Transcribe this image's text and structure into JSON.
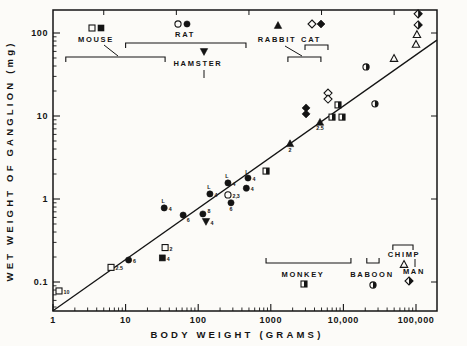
{
  "figure": {
    "background": "#fcfbf8",
    "ink_color": "#141414"
  },
  "chart_data": {
    "type": "scatter",
    "title": "",
    "xlabel": "BODY WEIGHT (GRAMS)",
    "ylabel": "WET WEIGHT OF GANGLION (mg)",
    "x_scale": "log",
    "y_scale": "log",
    "xlim": [
      1,
      194000
    ],
    "ylim": [
      0.045,
      190
    ],
    "grid": false,
    "x_ticks": {
      "values": [
        1,
        10,
        100,
        1000,
        10000,
        100000
      ],
      "labels": [
        "1",
        "10",
        "100",
        "1000",
        "10,000",
        "100,000"
      ]
    },
    "y_ticks": {
      "values": [
        100,
        10,
        1,
        0.1
      ],
      "labels": [
        "100",
        "10",
        "1",
        "0.1"
      ]
    },
    "trend_line": {
      "x1": 1,
      "y1": 0.045,
      "x2": 194000,
      "y2": 82
    },
    "series": [
      {
        "name": "MOUSE",
        "points": [
          {
            "x": 1.21,
            "y": 0.078,
            "symbol": "square-open",
            "label": "10",
            "label_pos": "right"
          },
          {
            "x": 6.3,
            "y": 0.15,
            "symbol": "square-open",
            "label": "2.5",
            "label_pos": "right"
          },
          {
            "x": 32,
            "y": 0.195,
            "symbol": "square-filled",
            "label": "4",
            "label_pos": "right"
          },
          {
            "x": 35,
            "y": 0.26,
            "symbol": "square-open",
            "label": "2",
            "label_pos": "right"
          }
        ]
      },
      {
        "name": "RAT",
        "points": [
          {
            "x": 11,
            "y": 0.184,
            "symbol": "circle-filled",
            "label": "6",
            "label_pos": "right"
          },
          {
            "x": 34,
            "y": 0.78,
            "symbol": "circle-filled",
            "label": "4",
            "label_pos": "right",
            "flag": "L"
          },
          {
            "x": 62,
            "y": 0.64,
            "symbol": "circle-filled",
            "label": "6",
            "label_pos": "below-right"
          },
          {
            "x": 116,
            "y": 0.66,
            "symbol": "circle-filled",
            "label": "8",
            "label_pos": "upper-right"
          },
          {
            "x": 145,
            "y": 1.15,
            "symbol": "circle-filled",
            "label": "4",
            "label_pos": "right",
            "flag": "L"
          },
          {
            "x": 257,
            "y": 1.56,
            "symbol": "circle-filled",
            "label": "4",
            "label_pos": "right",
            "flag": "L"
          },
          {
            "x": 257,
            "y": 1.12,
            "symbol": "circle-open",
            "label": "2,3",
            "label_pos": "right"
          },
          {
            "x": 283,
            "y": 0.9,
            "symbol": "circle-filled",
            "label": "6",
            "label_pos": "below"
          },
          {
            "x": 485,
            "y": 1.79,
            "symbol": "circle-filled",
            "label": "4",
            "label_pos": "right",
            "flag": "L"
          },
          {
            "x": 460,
            "y": 1.35,
            "symbol": "circle-filled",
            "label": "4",
            "label_pos": "right"
          }
        ]
      },
      {
        "name": "HAMSTER",
        "points": [
          {
            "x": 128,
            "y": 0.53,
            "symbol": "triangle-down-filled",
            "label": "4",
            "label_pos": "right"
          }
        ]
      },
      {
        "name": "RABBIT",
        "points": [
          {
            "x": 1840,
            "y": 4.7,
            "symbol": "triangle-up-filled",
            "label": "2",
            "label_pos": "below"
          },
          {
            "x": 4760,
            "y": 8.5,
            "symbol": "triangle-up-filled",
            "label": "2.5",
            "label_pos": "below"
          }
        ]
      },
      {
        "name": "CAT",
        "points": [
          {
            "x": 3060,
            "y": 12.5,
            "symbol": "diamond-filled"
          },
          {
            "x": 3060,
            "y": 10.6,
            "symbol": "diamond-filled"
          },
          {
            "x": 6140,
            "y": 18.9,
            "symbol": "diamond-open"
          },
          {
            "x": 6140,
            "y": 16,
            "symbol": "diamond-open"
          }
        ]
      },
      {
        "name": "MONKEY",
        "points": [
          {
            "x": 860,
            "y": 2.17,
            "symbol": "square-half"
          },
          {
            "x": 6970,
            "y": 9.7,
            "symbol": "square-half"
          },
          {
            "x": 8430,
            "y": 13.6,
            "symbol": "square-half"
          },
          {
            "x": 9570,
            "y": 9.7,
            "symbol": "square-half"
          }
        ]
      },
      {
        "name": "BABOON",
        "points": [
          {
            "x": 20500,
            "y": 39,
            "symbol": "circle-half"
          },
          {
            "x": 27200,
            "y": 14,
            "symbol": "circle-half"
          }
        ]
      },
      {
        "name": "CHIMP",
        "points": [
          {
            "x": 49800,
            "y": 50,
            "symbol": "triangle-up-open"
          },
          {
            "x": 103000,
            "y": 97,
            "symbol": "triangle-up-open"
          },
          {
            "x": 100000,
            "y": 74,
            "symbol": "triangle-up-open"
          }
        ]
      },
      {
        "name": "MAN",
        "points": [
          {
            "x": 107000,
            "y": 170,
            "symbol": "diamond-half"
          },
          {
            "x": 107000,
            "y": 125,
            "symbol": "diamond-half"
          }
        ]
      }
    ]
  },
  "legend": {
    "top": [
      {
        "label": "MOUSE",
        "symbols": [
          "square-open",
          "square-filled"
        ],
        "range_grams": [
          1.5,
          35
        ]
      },
      {
        "label": "RAT",
        "symbols": [
          "circle-open",
          "circle-filled"
        ],
        "range_grams": [
          10,
          455
        ]
      },
      {
        "label": "HAMSTER",
        "symbols": [
          "triangle-down-filled"
        ],
        "pointer_grams": 120
      },
      {
        "label": "RABBIT",
        "symbols": [
          "triangle-up-filled"
        ],
        "range_grams": [
          1720,
          4900
        ]
      },
      {
        "label": "CAT",
        "symbols": [
          "diamond-open",
          "diamond-filled"
        ],
        "range_grams": [
          2960,
          6130
        ]
      }
    ],
    "bottom": [
      {
        "label": "MONKEY",
        "symbols": [
          "square-half"
        ],
        "range_grams": [
          860,
          12700
        ]
      },
      {
        "label": "BABOON",
        "symbols": [
          "circle-half"
        ],
        "range_grams": [
          21000,
          31000
        ]
      },
      {
        "label": "CHIMP",
        "symbols": [
          "triangle-up-open"
        ],
        "range_grams": [
          48000,
          91000
        ]
      },
      {
        "label": "MAN",
        "symbols": [
          "diamond-half"
        ],
        "pointer_grams": 100000
      }
    ]
  }
}
